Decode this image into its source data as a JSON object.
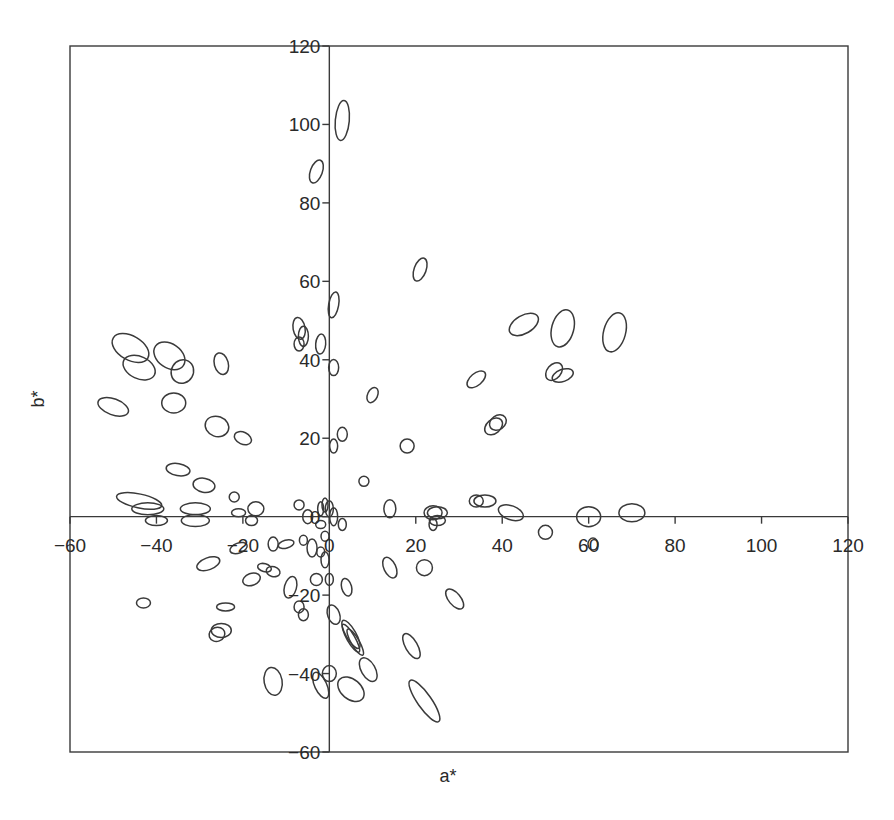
{
  "chart_data": {
    "type": "scatter",
    "subtype": "confidence-ellipses",
    "title": "",
    "xlabel": "a*",
    "ylabel": "b*",
    "xlim": [
      -60,
      120
    ],
    "ylim": [
      -60,
      120
    ],
    "x_ticks": [
      -60,
      -40,
      -20,
      0,
      20,
      40,
      60,
      80,
      100,
      120
    ],
    "y_ticks": [
      -60,
      -40,
      -20,
      0,
      20,
      40,
      60,
      80,
      100,
      120
    ],
    "x_tick_labels": [
      "−60",
      "−40",
      "−20",
      "0",
      "20",
      "40",
      "60",
      "80",
      "100",
      "120"
    ],
    "y_tick_labels": [
      "−60",
      "−40",
      "−20",
      "0",
      "20",
      "40",
      "60",
      "80",
      "100",
      "120"
    ],
    "axes_through_origin": true,
    "grid": false,
    "legend": null,
    "ellipse_units": "center in data units (a*, b*); rx/ry in pixels; rot in degrees",
    "ellipses": [
      {
        "a": 3,
        "b": 101,
        "rx": 7,
        "ry": 20,
        "rot": 5
      },
      {
        "a": -3,
        "b": 88,
        "rx": 6,
        "ry": 12,
        "rot": 20
      },
      {
        "a": 21,
        "b": 63,
        "rx": 6,
        "ry": 12,
        "rot": 20
      },
      {
        "a": 1,
        "b": 54,
        "rx": 5,
        "ry": 13,
        "rot": 10
      },
      {
        "a": -7,
        "b": 48,
        "rx": 6,
        "ry": 11,
        "rot": -10
      },
      {
        "a": -6,
        "b": 46,
        "rx": 5,
        "ry": 10,
        "rot": 0
      },
      {
        "a": -7,
        "b": 44,
        "rx": 5,
        "ry": 7,
        "rot": 0
      },
      {
        "a": -2,
        "b": 44,
        "rx": 5,
        "ry": 10,
        "rot": 5
      },
      {
        "a": 1,
        "b": 38,
        "rx": 5,
        "ry": 8,
        "rot": 0
      },
      {
        "a": 45,
        "b": 49,
        "rx": 16,
        "ry": 9,
        "rot": -30
      },
      {
        "a": 54,
        "b": 48,
        "rx": 11,
        "ry": 19,
        "rot": 15
      },
      {
        "a": 66,
        "b": 47,
        "rx": 11,
        "ry": 20,
        "rot": 15
      },
      {
        "a": 52,
        "b": 37,
        "rx": 7,
        "ry": 10,
        "rot": 40
      },
      {
        "a": 54,
        "b": 36,
        "rx": 11,
        "ry": 6,
        "rot": -20
      },
      {
        "a": 34,
        "b": 35,
        "rx": 11,
        "ry": 6,
        "rot": -40
      },
      {
        "a": 38,
        "b": 23,
        "rx": 10,
        "ry": 7,
        "rot": -40
      },
      {
        "a": 39,
        "b": 24,
        "rx": 9,
        "ry": 7,
        "rot": -35
      },
      {
        "a": 10,
        "b": 31,
        "rx": 5,
        "ry": 8,
        "rot": 25
      },
      {
        "a": 18,
        "b": 18,
        "rx": 7,
        "ry": 7,
        "rot": 0
      },
      {
        "a": 8,
        "b": 9,
        "rx": 5,
        "ry": 5,
        "rot": 0
      },
      {
        "a": 3,
        "b": 21,
        "rx": 5,
        "ry": 7,
        "rot": 0
      },
      {
        "a": 1,
        "b": 18,
        "rx": 4,
        "ry": 7,
        "rot": 0
      },
      {
        "a": -46,
        "b": 43,
        "rx": 20,
        "ry": 12,
        "rot": 30
      },
      {
        "a": -44,
        "b": 38,
        "rx": 17,
        "ry": 11,
        "rot": 25
      },
      {
        "a": -37,
        "b": 41,
        "rx": 17,
        "ry": 12,
        "rot": 35
      },
      {
        "a": -34,
        "b": 37,
        "rx": 11,
        "ry": 12,
        "rot": 30
      },
      {
        "a": -25,
        "b": 39,
        "rx": 7,
        "ry": 11,
        "rot": -15
      },
      {
        "a": -50,
        "b": 28,
        "rx": 16,
        "ry": 8,
        "rot": 20
      },
      {
        "a": -36,
        "b": 29,
        "rx": 12,
        "ry": 10,
        "rot": 0
      },
      {
        "a": -26,
        "b": 23,
        "rx": 12,
        "ry": 10,
        "rot": 20
      },
      {
        "a": -20,
        "b": 20,
        "rx": 9,
        "ry": 6,
        "rot": 25
      },
      {
        "a": -35,
        "b": 12,
        "rx": 12,
        "ry": 6,
        "rot": 10
      },
      {
        "a": -29,
        "b": 8,
        "rx": 11,
        "ry": 7,
        "rot": 10
      },
      {
        "a": -44,
        "b": 4,
        "rx": 23,
        "ry": 7,
        "rot": 12
      },
      {
        "a": -42,
        "b": 2,
        "rx": 16,
        "ry": 6,
        "rot": 0
      },
      {
        "a": -40,
        "b": -1,
        "rx": 11,
        "ry": 5,
        "rot": 0
      },
      {
        "a": -31,
        "b": 2,
        "rx": 15,
        "ry": 6,
        "rot": 0
      },
      {
        "a": -31,
        "b": -1,
        "rx": 14,
        "ry": 6,
        "rot": 0
      },
      {
        "a": -22,
        "b": 5,
        "rx": 5,
        "ry": 5,
        "rot": 0
      },
      {
        "a": -21,
        "b": 1,
        "rx": 7,
        "ry": 4,
        "rot": 0
      },
      {
        "a": -17,
        "b": 2,
        "rx": 8,
        "ry": 7,
        "rot": 0
      },
      {
        "a": -18,
        "b": -1,
        "rx": 6,
        "ry": 5,
        "rot": 0
      },
      {
        "a": -7,
        "b": 3,
        "rx": 5,
        "ry": 5,
        "rot": 0
      },
      {
        "a": -5,
        "b": 0,
        "rx": 5,
        "ry": 7,
        "rot": 0
      },
      {
        "a": -2,
        "b": 2,
        "rx": 3,
        "ry": 7,
        "rot": 0
      },
      {
        "a": -1,
        "b": 3,
        "rx": 3,
        "ry": 7,
        "rot": 0
      },
      {
        "a": 0,
        "b": 2,
        "rx": 4,
        "ry": 8,
        "rot": 0
      },
      {
        "a": 1,
        "b": 0,
        "rx": 4,
        "ry": 9,
        "rot": 0
      },
      {
        "a": 3,
        "b": -2,
        "rx": 4,
        "ry": 6,
        "rot": 0
      },
      {
        "a": -2,
        "b": -2,
        "rx": 5,
        "ry": 4,
        "rot": 0
      },
      {
        "a": 14,
        "b": 2,
        "rx": 6,
        "ry": 9,
        "rot": 0
      },
      {
        "a": 24,
        "b": 1,
        "rx": 9,
        "ry": 7,
        "rot": 0
      },
      {
        "a": 25,
        "b": 1,
        "rx": 10,
        "ry": 6,
        "rot": 0
      },
      {
        "a": 25,
        "b": -1,
        "rx": 8,
        "ry": 5,
        "rot": 0
      },
      {
        "a": 24,
        "b": -2,
        "rx": 4,
        "ry": 6,
        "rot": 0
      },
      {
        "a": 34,
        "b": 4,
        "rx": 7,
        "ry": 6,
        "rot": 0
      },
      {
        "a": 36,
        "b": 4,
        "rx": 11,
        "ry": 6,
        "rot": 0
      },
      {
        "a": 42,
        "b": 1,
        "rx": 13,
        "ry": 7,
        "rot": 20
      },
      {
        "a": 50,
        "b": -4,
        "rx": 7,
        "ry": 7,
        "rot": 0
      },
      {
        "a": 60,
        "b": 0,
        "rx": 12,
        "ry": 10,
        "rot": 0
      },
      {
        "a": 61,
        "b": -7,
        "rx": 5,
        "ry": 6,
        "rot": 0
      },
      {
        "a": 70,
        "b": 1,
        "rx": 13,
        "ry": 9,
        "rot": 0
      },
      {
        "a": -1,
        "b": -5,
        "rx": 4,
        "ry": 5,
        "rot": 0
      },
      {
        "a": -2,
        "b": -9,
        "rx": 4,
        "ry": 5,
        "rot": 0
      },
      {
        "a": -1,
        "b": -11,
        "rx": 4,
        "ry": 8,
        "rot": 0
      },
      {
        "a": -4,
        "b": -8,
        "rx": 5,
        "ry": 9,
        "rot": 0
      },
      {
        "a": -6,
        "b": -6,
        "rx": 4,
        "ry": 5,
        "rot": 0
      },
      {
        "a": -10,
        "b": -7,
        "rx": 8,
        "ry": 4,
        "rot": -15
      },
      {
        "a": -13,
        "b": -7,
        "rx": 5,
        "ry": 7,
        "rot": 0
      },
      {
        "a": -21,
        "b": -8,
        "rx": 9,
        "ry": 5,
        "rot": -20
      },
      {
        "a": -28,
        "b": -12,
        "rx": 12,
        "ry": 6,
        "rot": -20
      },
      {
        "a": -15,
        "b": -13,
        "rx": 7,
        "ry": 4,
        "rot": 15
      },
      {
        "a": -13,
        "b": -14,
        "rx": 7,
        "ry": 5,
        "rot": 15
      },
      {
        "a": -18,
        "b": -16,
        "rx": 9,
        "ry": 6,
        "rot": -20
      },
      {
        "a": -9,
        "b": -18,
        "rx": 6,
        "ry": 11,
        "rot": 15
      },
      {
        "a": -3,
        "b": -16,
        "rx": 6,
        "ry": 6,
        "rot": 0
      },
      {
        "a": 0,
        "b": -16,
        "rx": 4,
        "ry": 6,
        "rot": 0
      },
      {
        "a": 4,
        "b": -18,
        "rx": 5,
        "ry": 9,
        "rot": -15
      },
      {
        "a": -43,
        "b": -22,
        "rx": 7,
        "ry": 5,
        "rot": 0
      },
      {
        "a": -24,
        "b": -23,
        "rx": 9,
        "ry": 4,
        "rot": 0
      },
      {
        "a": -7,
        "b": -23,
        "rx": 5,
        "ry": 6,
        "rot": 0
      },
      {
        "a": -6,
        "b": -25,
        "rx": 5,
        "ry": 6,
        "rot": 0
      },
      {
        "a": 1,
        "b": -25,
        "rx": 6,
        "ry": 10,
        "rot": -20
      },
      {
        "a": 14,
        "b": -13,
        "rx": 6,
        "ry": 11,
        "rot": -25
      },
      {
        "a": 22,
        "b": -13,
        "rx": 8,
        "ry": 8,
        "rot": 0
      },
      {
        "a": 29,
        "b": -21,
        "rx": 6,
        "ry": 12,
        "rot": -40
      },
      {
        "a": -26,
        "b": -30,
        "rx": 8,
        "ry": 7,
        "rot": -20
      },
      {
        "a": -25,
        "b": -29,
        "rx": 10,
        "ry": 7,
        "rot": 0
      },
      {
        "a": 5,
        "b": -30,
        "rx": 5,
        "ry": 16,
        "rot": -30
      },
      {
        "a": 5,
        "b": -31,
        "rx": 4,
        "ry": 16,
        "rot": -30
      },
      {
        "a": 6,
        "b": -32,
        "rx": 4,
        "ry": 15,
        "rot": -30
      },
      {
        "a": 19,
        "b": -33,
        "rx": 6,
        "ry": 14,
        "rot": -30
      },
      {
        "a": 9,
        "b": -39,
        "rx": 7,
        "ry": 13,
        "rot": -30
      },
      {
        "a": -13,
        "b": -42,
        "rx": 9,
        "ry": 14,
        "rot": -10
      },
      {
        "a": 0,
        "b": -40,
        "rx": 7,
        "ry": 8,
        "rot": 0
      },
      {
        "a": -2,
        "b": -43,
        "rx": 6,
        "ry": 14,
        "rot": -25
      },
      {
        "a": 5,
        "b": -44,
        "rx": 10,
        "ry": 15,
        "rot": -50
      },
      {
        "a": 22,
        "b": -47,
        "rx": 7,
        "ry": 25,
        "rot": -35
      }
    ]
  }
}
